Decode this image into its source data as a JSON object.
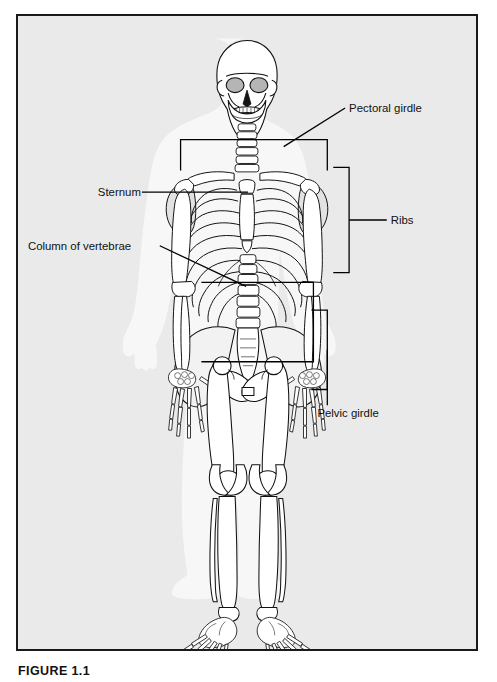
{
  "figure": {
    "caption_number": "FIGURE 1.1",
    "caption_text": "",
    "panel_background": "#eaeaea",
    "border_color": "#1a1a1a",
    "line_color": "#000000",
    "bone_fill": "#ffffff",
    "bone_shade": "#c9c9c9",
    "body_silhouette": "#f7f7f7"
  },
  "labels": {
    "pectoral_girdle": "Pectoral girdle",
    "sternum": "Sternum",
    "ribs": "Ribs",
    "column_of_vertebrae": "Column of vertebrae",
    "pelvic_girdle": "Pelvic girdle"
  },
  "diagram": {
    "regions": [
      "skull",
      "cervical-vertebrae",
      "clavicle",
      "scapula",
      "sternum",
      "rib-cage",
      "lumbar-vertebrae",
      "pelvis",
      "sacrum",
      "humerus",
      "radius",
      "ulna",
      "hand",
      "femur",
      "patella",
      "tibia",
      "fibula",
      "foot"
    ]
  }
}
